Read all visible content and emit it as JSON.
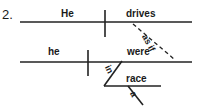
{
  "item": {
    "number": "2."
  },
  "diagram": {
    "type": "reed-kellogg-sentence-diagram",
    "line_color": "#222222",
    "text_color": "#1a1a1a",
    "background": "#ffffff",
    "main_clause": {
      "subject": "He",
      "verb": "drives"
    },
    "subordinate_clause": {
      "conjunction": "as if",
      "subject": "he",
      "verb": "were"
    },
    "prepositional_phrase": {
      "preposition": "in",
      "object": "race",
      "modifier": "a"
    }
  }
}
